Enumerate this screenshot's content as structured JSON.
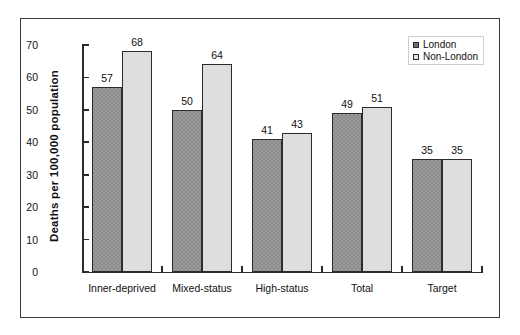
{
  "chart_data": {
    "type": "bar",
    "title": "",
    "xlabel": "",
    "ylabel": "Deaths per 100,000 population",
    "ylim": [
      0,
      70
    ],
    "yticks": [
      0,
      10,
      20,
      30,
      40,
      50,
      60,
      70
    ],
    "grid": false,
    "legend_position": "top-right",
    "categories": [
      "Inner-deprived",
      "Mixed-status",
      "High-status",
      "Total",
      "Target"
    ],
    "series": [
      {
        "name": "London",
        "values": [
          57,
          50,
          41,
          49,
          35
        ]
      },
      {
        "name": "Non-London",
        "values": [
          68,
          64,
          43,
          51,
          35
        ]
      }
    ]
  },
  "legend": {
    "items": [
      {
        "label": "London"
      },
      {
        "label": "Non-London"
      }
    ]
  },
  "colors": {
    "london": "#8c8c8c",
    "nonlondon": "#dedede",
    "axis": "#2b2b2b",
    "frame": "#3a3a3a"
  }
}
